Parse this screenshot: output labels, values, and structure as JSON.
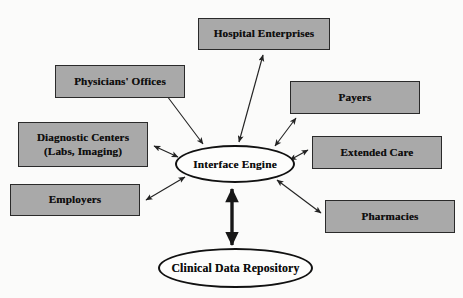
{
  "diagram": {
    "type": "hub-and-spoke",
    "colors": {
      "background": "#fbfbfa",
      "box_fill": "#a9a9a9",
      "box_border": "#2a2a2a",
      "ellipse_fill": "#fdfdfc",
      "ellipse_border": "#111111",
      "arrow": "#232323",
      "text": "#0d0d0d"
    },
    "hub": {
      "id": "interface-engine",
      "label": "Interface Engine",
      "shape": "ellipse",
      "x": 175,
      "y": 145,
      "width": 120,
      "height": 38
    },
    "repository": {
      "id": "clinical-data-repository",
      "label": "Clinical Data Repository",
      "shape": "ellipse",
      "x": 158,
      "y": 248,
      "width": 155,
      "height": 40
    },
    "nodes": [
      {
        "id": "hospital-enterprises",
        "label": "Hospital Enterprises",
        "lines": [
          "Hospital Enterprises"
        ],
        "shape": "rect",
        "x": 198,
        "y": 18,
        "width": 132,
        "height": 32
      },
      {
        "id": "physicians-offices",
        "label": "Physicians' Offices",
        "lines": [
          "Physicians' Offices"
        ],
        "shape": "rect",
        "x": 55,
        "y": 65,
        "width": 130,
        "height": 33
      },
      {
        "id": "diagnostic-centers",
        "label": "Diagnostic Centers (Labs, Imaging)",
        "lines": [
          "Diagnostic Centers",
          "(Labs, Imaging)"
        ],
        "shape": "rect",
        "x": 18,
        "y": 122,
        "width": 130,
        "height": 45
      },
      {
        "id": "employers",
        "label": "Employers",
        "lines": [
          "Employers"
        ],
        "shape": "rect",
        "x": 10,
        "y": 184,
        "width": 130,
        "height": 32
      },
      {
        "id": "payers",
        "label": "Payers",
        "lines": [
          "Payers"
        ],
        "shape": "rect",
        "x": 290,
        "y": 81,
        "width": 130,
        "height": 33
      },
      {
        "id": "extended-care",
        "label": "Extended Care",
        "lines": [
          "Extended Care"
        ],
        "shape": "rect",
        "x": 312,
        "y": 136,
        "width": 130,
        "height": 33
      },
      {
        "id": "pharmacies",
        "label": "Pharmacies",
        "lines": [
          "Pharmacies"
        ],
        "shape": "rect",
        "x": 325,
        "y": 200,
        "width": 130,
        "height": 33
      }
    ],
    "connections": [
      {
        "id": "conn-hospital-enterprises",
        "from": "interface-engine",
        "to": "hospital-enterprises",
        "style": "thin",
        "arrowheads": "both"
      },
      {
        "id": "conn-physicians-offices",
        "from": "interface-engine",
        "to": "physicians-offices",
        "style": "thin",
        "arrowheads": "both"
      },
      {
        "id": "conn-diagnostic-centers",
        "from": "interface-engine",
        "to": "diagnostic-centers",
        "style": "thin",
        "arrowheads": "both"
      },
      {
        "id": "conn-employers",
        "from": "interface-engine",
        "to": "employers",
        "style": "thin",
        "arrowheads": "both"
      },
      {
        "id": "conn-payers",
        "from": "interface-engine",
        "to": "payers",
        "style": "thin",
        "arrowheads": "both"
      },
      {
        "id": "conn-extended-care",
        "from": "interface-engine",
        "to": "extended-care",
        "style": "thin",
        "arrowheads": "both"
      },
      {
        "id": "conn-pharmacies",
        "from": "interface-engine",
        "to": "pharmacies",
        "style": "thin",
        "arrowheads": "both"
      },
      {
        "id": "conn-clinical-data-repository",
        "from": "interface-engine",
        "to": "clinical-data-repository",
        "style": "thick",
        "arrowheads": "both"
      }
    ]
  }
}
